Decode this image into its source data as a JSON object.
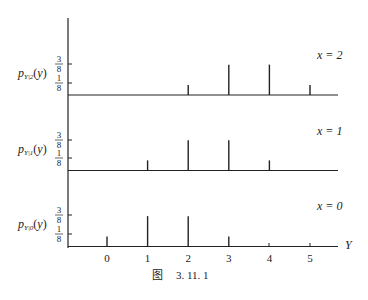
{
  "chart_data": {
    "type": "bar",
    "subtype": "stem / probability mass function panels",
    "title": "",
    "caption": "图   3. 11. 1",
    "xlabel": "Y",
    "x_ticks": [
      "0",
      "1",
      "2",
      "3",
      "4",
      "5"
    ],
    "y_ticks": [
      "1/8",
      "3/8"
    ],
    "ylim": [
      0,
      0.5
    ],
    "panels": [
      {
        "label": "x = 2",
        "ylabel": "p_{Y|2}(y)",
        "ylabel_main": "p",
        "ylabel_sub": "Y|2",
        "ylabel_tail": "(y)",
        "x": [
          2,
          3,
          4,
          5
        ],
        "values": [
          0.125,
          0.375,
          0.375,
          0.125
        ],
        "value_labels": [
          "1/8",
          "3/8",
          "3/8",
          "1/8"
        ]
      },
      {
        "label": "x = 1",
        "ylabel": "p_{Y|1}(y)",
        "ylabel_main": "p",
        "ylabel_sub": "Y|1",
        "ylabel_tail": "(y)",
        "x": [
          1,
          2,
          3,
          4
        ],
        "values": [
          0.125,
          0.375,
          0.375,
          0.125
        ],
        "value_labels": [
          "1/8",
          "3/8",
          "3/8",
          "1/8"
        ]
      },
      {
        "label": "x = 0",
        "ylabel": "p_{Y|0}(y)",
        "ylabel_main": "p",
        "ylabel_sub": "Y|0",
        "ylabel_tail": "(y)",
        "x": [
          0,
          1,
          2,
          3
        ],
        "values": [
          0.125,
          0.375,
          0.375,
          0.125
        ],
        "value_labels": [
          "1/8",
          "3/8",
          "3/8",
          "1/8"
        ]
      }
    ],
    "grid": false,
    "legend": "none"
  },
  "fraction": {
    "three_num": "3",
    "one_num": "1",
    "den": "8"
  },
  "axis_label": "Y",
  "caption": {
    "fig": "图",
    "number": "3. 11. 1"
  }
}
